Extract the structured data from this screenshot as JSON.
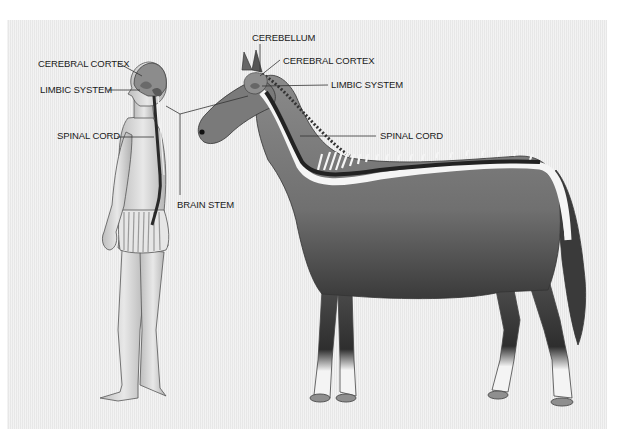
{
  "diagram": {
    "subjects": [
      "human",
      "horse"
    ],
    "human_labels": {
      "cerebral_cortex": "CEREBRAL CORTEX",
      "limbic_system": "LIMBIC SYSTEM",
      "spinal_cord": "SPINAL CORD",
      "brain_stem": "BRAIN STEM"
    },
    "horse_labels": {
      "cerebellum": "CEREBELLUM",
      "cerebral_cortex": "CEREBRAL CORTEX",
      "limbic_system": "LIMBIC SYSTEM",
      "spinal_cord": "SPINAL CORD"
    },
    "colors": {
      "background": "#ececec",
      "skin": "#dcdcdc",
      "horse_body": "#7a7a7a",
      "spinal_cord": "#2a2a2a",
      "vertebrae": "#f5f5f5",
      "leader_line": "#333333"
    }
  }
}
